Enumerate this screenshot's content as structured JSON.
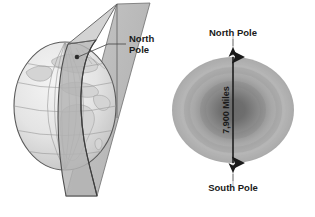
{
  "figure": {
    "background_color": "#ffffff",
    "panels": [
      {
        "id": "globe-plane",
        "name": "earth-globe-with-meridian-plane",
        "annotations": [
          {
            "name": "north-pole-label",
            "line1": "North",
            "line2": "Pole"
          }
        ]
      },
      {
        "id": "oblate-ellipse",
        "name": "earth-cross-section-ellipse",
        "annotations": [
          {
            "name": "north-pole-label",
            "text": "North Pole"
          },
          {
            "name": "south-pole-label",
            "text": "South Pole"
          },
          {
            "name": "diameter-label",
            "text": "7,900 Miles"
          }
        ]
      }
    ],
    "colors": {
      "ink": "#1a1a1a",
      "globe_fill": "#e8e8e8",
      "globe_outline": "#4a4a4a",
      "plane_fill": "#b8b8b8",
      "grid": "#9a9a9a",
      "land": "#cfcfcf",
      "ellipse_light": "#b9b9b9",
      "ellipse_dark": "#6e6e6e"
    }
  }
}
